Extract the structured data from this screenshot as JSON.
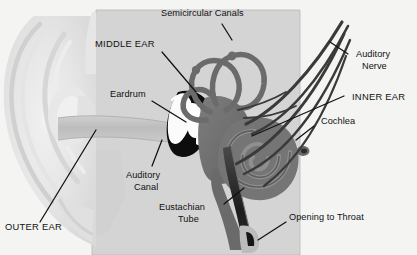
{
  "figure": {
    "background_color": "#f4f4f3",
    "text_color": "#111111"
  },
  "palette": {
    "background": "#f4f4f3",
    "head_block": "#d4d4d4",
    "pinna_light": "#e9e9e9",
    "pinna_shade": "#dcdcdc",
    "ear_canal": "#c2c2c2",
    "inner_ear_dark": "#6e6e6e",
    "inner_ear_mid": "#8a8a8a",
    "cavity_black": "#0d0d0d",
    "ossicle_white": "#fdfdfd",
    "leader_line": "#111111"
  },
  "labels": [
    {
      "id": "semicircular-canals",
      "text": "Semicircular Canals",
      "lines": [
        "Semicircular Canals"
      ],
      "style": "title-case"
    },
    {
      "id": "middle-ear",
      "text": "MIDDLE EAR",
      "lines": [
        "MIDDLE EAR"
      ],
      "style": "caps"
    },
    {
      "id": "eardrum",
      "text": "Eardrum",
      "lines": [
        "Eardrum"
      ],
      "style": "title-case"
    },
    {
      "id": "auditory-nerve",
      "text": "Auditory Nerve",
      "lines": [
        "Auditory",
        "Nerve"
      ],
      "style": "title-case"
    },
    {
      "id": "inner-ear",
      "text": "INNER EAR",
      "lines": [
        "INNER EAR"
      ],
      "style": "caps"
    },
    {
      "id": "cochlea",
      "text": "Cochlea",
      "lines": [
        "Cochlea"
      ],
      "style": "title-case"
    },
    {
      "id": "auditory-canal",
      "text": "Auditory Canal",
      "lines": [
        "Auditory",
        "Canal"
      ],
      "style": "title-case"
    },
    {
      "id": "eustachian-tube",
      "text": "Eustachian Tube",
      "lines": [
        "Eustachian",
        "Tube"
      ],
      "style": "title-case"
    },
    {
      "id": "opening-to-throat",
      "text": "Opening to Throat",
      "lines": [
        "Opening to Throat"
      ],
      "style": "title-case"
    },
    {
      "id": "outer-ear",
      "text": "OUTER EAR",
      "lines": [
        "OUTER EAR"
      ],
      "style": "caps"
    }
  ],
  "label_text": {
    "semicircular_canals": "Semicircular Canals",
    "middle_ear": "MIDDLE EAR",
    "eardrum": "Eardrum",
    "auditory_nerve_1": "Auditory",
    "auditory_nerve_2": "Nerve",
    "inner_ear": "INNER EAR",
    "cochlea": "Cochlea",
    "auditory_canal_1": "Auditory",
    "auditory_canal_2": "Canal",
    "eustachian_tube_1": "Eustachian",
    "eustachian_tube_2": "Tube",
    "opening_to_throat": "Opening to Throat",
    "outer_ear": "OUTER EAR"
  },
  "parts": [
    {
      "id": "pinna",
      "name": "outer ear pinna",
      "region": "left"
    },
    {
      "id": "ear-canal",
      "name": "auditory canal",
      "region": "center-left"
    },
    {
      "id": "eardrum",
      "name": "tympanic membrane",
      "region": "center"
    },
    {
      "id": "ossicles",
      "name": "middle ear bones",
      "region": "center"
    },
    {
      "id": "semicircular-canals",
      "name": "semicircular canals",
      "region": "center-right"
    },
    {
      "id": "cochlea",
      "name": "cochlea spiral",
      "region": "right"
    },
    {
      "id": "auditory-nerve",
      "name": "auditory nerve bundle",
      "region": "upper-right"
    },
    {
      "id": "eustachian-tube",
      "name": "eustachian tube",
      "region": "lower-center"
    }
  ]
}
